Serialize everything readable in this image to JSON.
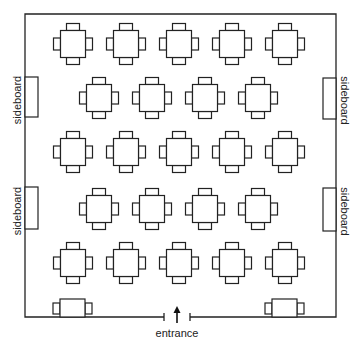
{
  "diagram": {
    "type": "floor-plan",
    "stroke_color": "#222222",
    "background": "#ffffff",
    "room": {
      "left": 25,
      "top": 14,
      "right": 336,
      "bottom": 317
    },
    "entrance": {
      "label": "entrance",
      "gap_left": 164,
      "gap_right": 190,
      "arrow_x": 177
    },
    "sideboards": [
      {
        "label": "sideboard",
        "side": "left",
        "y1": 77,
        "y2": 117
      },
      {
        "label": "sideboard",
        "side": "left",
        "y1": 187,
        "y2": 229
      },
      {
        "label": "sideboard",
        "side": "right",
        "y1": 78,
        "y2": 119
      },
      {
        "label": "sideboard",
        "side": "right",
        "y1": 188,
        "y2": 231
      }
    ],
    "table_rows": [
      {
        "y": 44,
        "x": [
          73,
          126,
          179,
          232,
          285
        ]
      },
      {
        "y": 98,
        "x": [
          99,
          152,
          205,
          258
        ]
      },
      {
        "y": 152,
        "x": [
          73,
          126,
          179,
          232,
          285
        ]
      },
      {
        "y": 209,
        "x": [
          99,
          152,
          205,
          258
        ]
      },
      {
        "y": 263,
        "x": [
          73,
          126,
          179,
          232,
          285
        ]
      }
    ],
    "table_count_square": 23,
    "wall_tables": [
      {
        "x": 72.5,
        "side": "bottom-left"
      },
      {
        "x": 284.5,
        "side": "bottom-right"
      }
    ],
    "labels": {
      "sideboard": "sideboard",
      "entrance": "entrance"
    }
  }
}
